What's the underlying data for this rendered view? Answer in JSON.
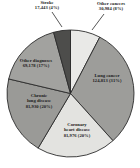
{
  "chart_data": {
    "type": "pie",
    "title": "",
    "subtitle": "",
    "xlabel": "",
    "ylabel": "",
    "legend_position": "none",
    "grid": false,
    "total": 406324,
    "categories": [
      "Other cancers",
      "Lung cancer",
      "Coronary heart disease",
      "Chronic lung disease",
      "Other diagnoses",
      "Stroke"
    ],
    "values": [
      30984,
      124813,
      81976,
      81930,
      69178,
      17443
    ],
    "percents": [
      8,
      31,
      20,
      20,
      17,
      4
    ],
    "slice_colors": [
      "#e9e9e7",
      "#9d9d9a",
      "#e3e3e0",
      "#9a9a97",
      "#a2a29f",
      "#4d4d4b"
    ],
    "slices": [
      {
        "name": "other-cancers",
        "label": "Other cancers",
        "value": "30,984",
        "percent": "(8%)",
        "value_percent": "30,984 (8%)",
        "color": "#e9e9e7"
      },
      {
        "name": "lung-cancer",
        "label": "Lung cancer",
        "value": "124,813",
        "percent": "(31%)",
        "value_percent": "124,813 (31%)",
        "color": "#9d9d9a"
      },
      {
        "name": "coronary-heart-disease",
        "label_line1": "Coronary",
        "label_line2": "heart disease",
        "label": "Coronary heart disease",
        "value": "81,976",
        "percent": "(20%)",
        "value_percent": "81,976 (20%)",
        "color": "#e3e3e0"
      },
      {
        "name": "chronic-lung-disease",
        "label_line1": "Chronic",
        "label_line2": "lung disease",
        "label": "Chronic lung disease",
        "value": "81,930",
        "percent": "(20%)",
        "value_percent": "81,930 (20%)",
        "color": "#9a9a97"
      },
      {
        "name": "other-diagnoses",
        "label": "Other diagnoses",
        "value": "69,178",
        "percent": "(17%)",
        "value_percent": "69,178 (17%)",
        "color": "#a2a29f"
      },
      {
        "name": "stroke",
        "label": "Stroke",
        "value": "17,443",
        "percent": "(4%)",
        "value_percent": "17,443 (4%)",
        "color": "#4d4d4b"
      }
    ]
  },
  "labels": {
    "stroke_line1": "Stroke",
    "stroke_line2": "17,443 (4%)",
    "other_cancers_line1": "Other cancers",
    "other_cancers_line2": "30,984 (8%)",
    "lung_line1": "Lung cancer",
    "lung_line2": "124,813 (31%)",
    "coronary_line1": "Coronary",
    "coronary_line2": "heart disease",
    "coronary_line3": "81,976 (20%)",
    "chronic_line1": "Chronic",
    "chronic_line2": "lung disease",
    "chronic_line3": "81,930 (20%)",
    "other_diag_line1": "Other diagnoses",
    "other_diag_line2": "69,178 (17%)"
  }
}
